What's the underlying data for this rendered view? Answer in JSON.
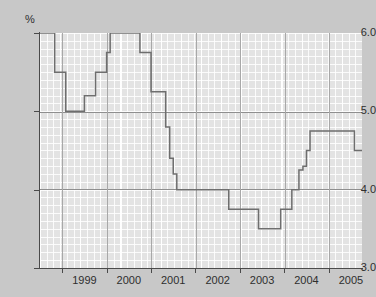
{
  "chart_data": {
    "type": "line",
    "title": "",
    "subtitle": "",
    "xlabel": "",
    "ylabel": "",
    "unit_label": "%",
    "ylim": [
      3.0,
      6.0
    ],
    "xlim": [
      1998.5,
      2005.75
    ],
    "grid": true,
    "legend": null,
    "y_ticks": [
      "6.0",
      "5.0",
      "4.0",
      "3.0"
    ],
    "y_tick_values": [
      6.0,
      5.0,
      4.0,
      3.0
    ],
    "x_ticks": [
      "1999",
      "2000",
      "2001",
      "2002",
      "2003",
      "2004",
      "2005"
    ],
    "x_tick_values": [
      1999,
      2000,
      2001,
      2002,
      2003,
      2004,
      2005
    ],
    "series": [
      {
        "name": "Interest rate",
        "step": true,
        "x": [
          1998.5,
          1998.75,
          1998.83,
          1999.0,
          1999.08,
          1999.17,
          1999.33,
          1999.5,
          1999.58,
          1999.75,
          1999.83,
          2000.0,
          2000.08,
          2000.58,
          2000.67,
          2000.75,
          2000.83,
          2001.0,
          2001.08,
          2001.17,
          2001.33,
          2001.42,
          2001.5,
          2001.58,
          2002.0,
          2002.5,
          2002.67,
          2002.75,
          2003.0,
          2003.33,
          2003.42,
          2003.58,
          2003.67,
          2003.92,
          2004.0,
          2004.08,
          2004.17,
          2004.25,
          2004.33,
          2004.42,
          2004.5,
          2004.58,
          2005.0,
          2005.5,
          2005.58,
          2005.75
        ],
        "y": [
          6.0,
          6.0,
          5.5,
          5.5,
          5.0,
          5.0,
          5.0,
          5.2,
          5.2,
          5.5,
          5.5,
          5.75,
          6.0,
          6.0,
          6.0,
          5.75,
          5.75,
          5.25,
          5.25,
          5.25,
          4.8,
          4.4,
          4.2,
          4.0,
          4.0,
          4.0,
          4.0,
          3.75,
          3.75,
          3.75,
          3.5,
          3.5,
          3.5,
          3.75,
          3.75,
          3.75,
          4.0,
          4.0,
          4.25,
          4.3,
          4.5,
          4.75,
          4.75,
          4.75,
          4.5,
          4.5
        ]
      }
    ],
    "annotations": [],
    "colors": {
      "line": "#6e6e6e",
      "plot_background": "#e3e3e3",
      "figure_background": "#c8c8c8",
      "gridline_major": "#8f8f8f",
      "gridline_minor": "#ffffff",
      "axis": "#4a4a4a",
      "text": "#2e2e2e"
    }
  }
}
